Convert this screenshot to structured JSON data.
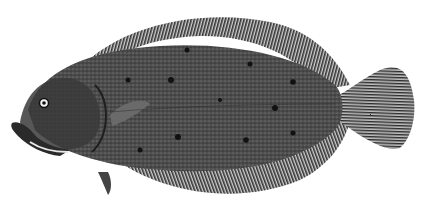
{
  "image": {
    "subject": "flounder engraving",
    "background": "#ffffff",
    "ink_dark": "#2a2a2a",
    "ink_mid": "#555555",
    "ink_light": "#8a8a8a"
  }
}
